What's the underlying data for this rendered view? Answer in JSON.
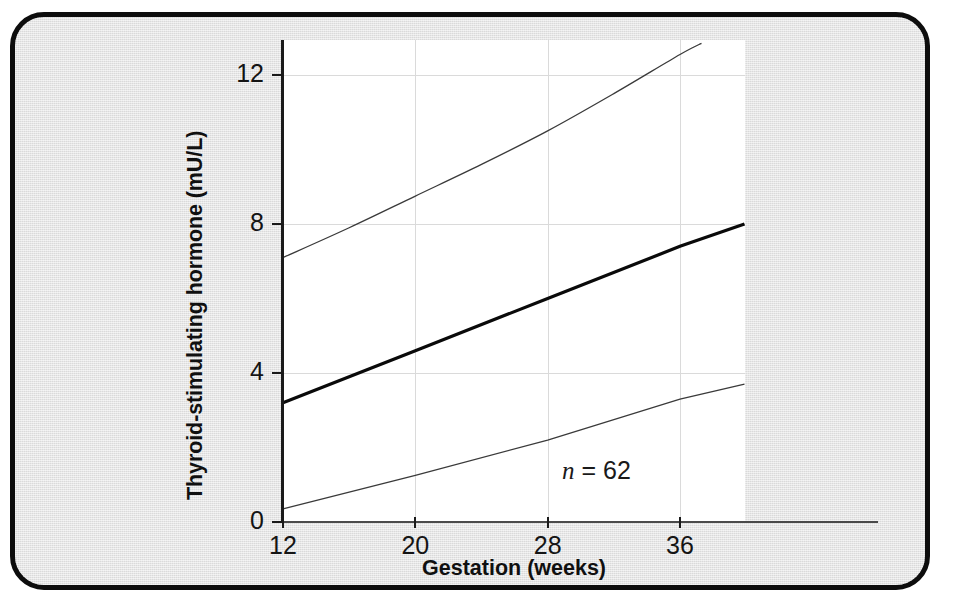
{
  "figure": {
    "frame_border_color": "#0d0d0d",
    "panel_background": "#e3e3e3",
    "plot_background": "#ffffff",
    "gridline_color": "#dadada",
    "axis_color": "#1a1a1a"
  },
  "chart_data": {
    "type": "line",
    "title": "",
    "subtitle": "",
    "xlabel": "Gestation (weeks)",
    "ylabel": "Thyroid-stimulating hormone (mU/L)",
    "xlim": [
      12,
      40
    ],
    "ylim": [
      0,
      13
    ],
    "xticks": [
      12,
      20,
      28,
      36
    ],
    "xticklabels": [
      "12",
      "20",
      "28",
      "36"
    ],
    "yticks": [
      0,
      4,
      8,
      12
    ],
    "yticklabels": [
      "0",
      "4",
      "8",
      "12"
    ],
    "grid": true,
    "legend": false,
    "legend_position": "none",
    "annotations": [
      {
        "text": "n = 62",
        "x": 31.0,
        "y": 1.75,
        "italic_variable": "n",
        "value": 62
      }
    ],
    "series": [
      {
        "name": "Upper reference limit (97.5th centile)",
        "style": "thin",
        "linewidth": 1.3,
        "color": "#3a3a3a",
        "shape": "slightly convex curve",
        "x": [
          12,
          16,
          20,
          24,
          28,
          32,
          36,
          37.3
        ],
        "values": [
          7.1,
          7.9,
          8.75,
          9.6,
          10.5,
          11.5,
          12.55,
          12.85
        ]
      },
      {
        "name": "Median",
        "style": "bold",
        "linewidth": 3.2,
        "color": "#0a0a0a",
        "shape": "straight line",
        "x": [
          12,
          20,
          28,
          36,
          39.9
        ],
        "values": [
          3.2,
          4.6,
          6.0,
          7.4,
          8.0
        ]
      },
      {
        "name": "Lower reference limit (2.5th centile)",
        "style": "thin",
        "linewidth": 1.3,
        "color": "#3a3a3a",
        "shape": "straight line",
        "x": [
          12,
          20,
          28,
          36,
          39.9
        ],
        "values": [
          0.35,
          1.25,
          2.2,
          3.3,
          3.7
        ]
      }
    ]
  }
}
